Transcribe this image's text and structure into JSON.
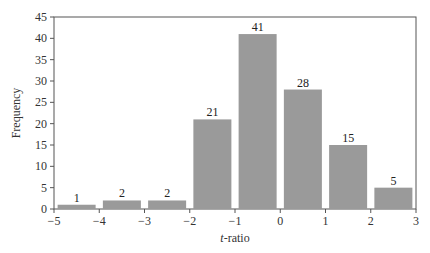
{
  "chart_data": {
    "type": "bar",
    "title": "",
    "xlabel_italic": "t",
    "xlabel_rest": "-ratio",
    "xlabel": "t-ratio",
    "ylabel": "Frequency",
    "xlim": [
      -5,
      3
    ],
    "ylim": [
      0,
      45
    ],
    "xticks": [
      -5,
      -4,
      -3,
      -2,
      -1,
      0,
      1,
      2,
      3
    ],
    "xtick_labels": [
      "−5",
      "−4",
      "−3",
      "−2",
      "−1",
      "0",
      "1",
      "2",
      "3"
    ],
    "yticks": [
      0,
      5,
      10,
      15,
      20,
      25,
      30,
      35,
      40,
      45
    ],
    "ytick_labels": [
      "0",
      "5",
      "10",
      "15",
      "20",
      "25",
      "30",
      "35",
      "40",
      "45"
    ],
    "bin_centers": [
      -4.5,
      -3.5,
      -2.5,
      -1.5,
      -0.5,
      0.5,
      1.5,
      2.5
    ],
    "categories": [
      "-5 to -4",
      "-4 to -3",
      "-3 to -2",
      "-2 to -1",
      "-1 to 0",
      "0 to 1",
      "1 to 2",
      "2 to 3"
    ],
    "values": [
      1,
      2,
      2,
      21,
      41,
      28,
      15,
      5
    ],
    "data_labels": [
      "1",
      "2",
      "2",
      "21",
      "41",
      "28",
      "15",
      "5"
    ],
    "bar_color": "#9a9a9a",
    "grid": false,
    "legend": null
  }
}
